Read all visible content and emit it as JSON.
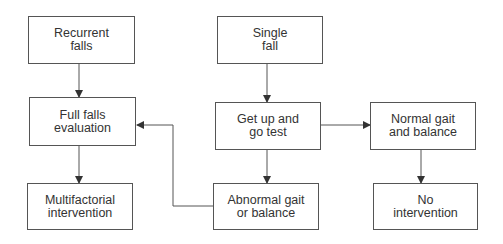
{
  "nodes": {
    "recurrent_falls": "Recurrent\nfalls",
    "single_fall": "Single\nfall",
    "full_falls_evaluation": "Full falls\nevaluation",
    "get_up_and_go_test": "Get up and\ngo test",
    "normal_gait_and_balance": "Normal gait\nand balance",
    "multifactorial_intervention": "Multifactorial\nintervention",
    "abnormal_gait_or_balance": "Abnormal gait\nor balance",
    "no_intervention": "No\nintervention"
  },
  "edges": [
    {
      "from": "recurrent_falls",
      "to": "full_falls_evaluation"
    },
    {
      "from": "single_fall",
      "to": "get_up_and_go_test"
    },
    {
      "from": "get_up_and_go_test",
      "to": "normal_gait_and_balance"
    },
    {
      "from": "get_up_and_go_test",
      "to": "abnormal_gait_or_balance"
    },
    {
      "from": "full_falls_evaluation",
      "to": "multifactorial_intervention"
    },
    {
      "from": "normal_gait_and_balance",
      "to": "no_intervention"
    },
    {
      "from": "abnormal_gait_or_balance",
      "to": "full_falls_evaluation"
    }
  ]
}
